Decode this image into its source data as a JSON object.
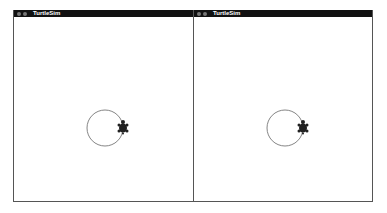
{
  "windows": [
    {
      "title": "TurtleSim",
      "circle": {
        "cx": 91,
        "cy": 111,
        "r": 18
      },
      "turtle": {
        "x": 109,
        "y": 111
      }
    },
    {
      "title": "TurtleSim",
      "circle": {
        "cx": 91,
        "cy": 111,
        "r": 18
      },
      "turtle": {
        "x": 109,
        "y": 111
      }
    }
  ],
  "colors": {
    "titlebar": "#111111",
    "background": "#ffffff",
    "path": "#555555",
    "turtle": "#222222"
  }
}
